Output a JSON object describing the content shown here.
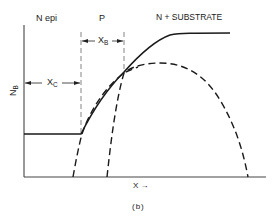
{
  "figure": {
    "caption": "(b)",
    "regions": {
      "n_epi": "N epi",
      "p": "P",
      "substrate": "N + SUBSTRATE"
    },
    "dimensions": {
      "xc": {
        "main": "X",
        "sub": "C"
      },
      "xb": {
        "main": "X",
        "sub": "B"
      }
    },
    "axes": {
      "y_label": {
        "main": "N",
        "sub": "B"
      },
      "x_label": "X →"
    },
    "curves": [
      {
        "name": "net-doping-profile",
        "style": "solid"
      },
      {
        "name": "base-diffusion-profile",
        "style": "dashed"
      },
      {
        "name": "emitter-side-profile",
        "style": "dashed"
      }
    ],
    "colors": {
      "line": "#1a1a1a",
      "guide": "#555555",
      "background": "#ffffff"
    }
  }
}
